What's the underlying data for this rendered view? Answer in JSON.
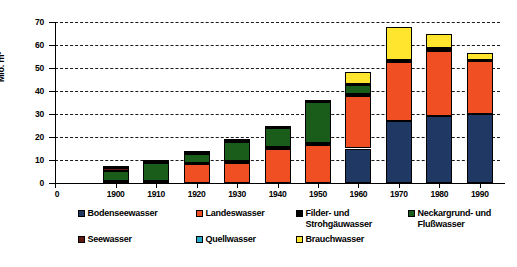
{
  "chart_data": {
    "type": "bar",
    "subtype": "stacked-column",
    "title": "",
    "xlabel": "",
    "ylabel": "Mio. m³",
    "ylim": [
      0,
      70
    ],
    "ytick_step": 10,
    "yticks": [
      "0",
      "10",
      "20",
      "30",
      "40",
      "50",
      "60",
      "70"
    ],
    "grid": true,
    "grid_style": "dashed-horizontal",
    "legend_position": "bottom",
    "origin_tick_label": "0",
    "categories": [
      "1900",
      "1910",
      "1920",
      "1930",
      "1940",
      "1950",
      "1960",
      "1970",
      "1980",
      "1990"
    ],
    "series": [
      {
        "name": "Bodenseewasser",
        "color": "#1F3864",
        "values": [
          0,
          0,
          0,
          0,
          0,
          0,
          15.0,
          27.0,
          29.0,
          30.0
        ]
      },
      {
        "name": "Landeswasser",
        "color": "#F04E23",
        "values": [
          0,
          0,
          8.2,
          8.8,
          15.0,
          16.5,
          23.0,
          25.5,
          28.5,
          23.0
        ]
      },
      {
        "name": "Filder- und\nStrohgäuwasser",
        "color": "#000000",
        "values": [
          0.7,
          0.8,
          0.7,
          0.7,
          0.7,
          0.7,
          0.8,
          1.0,
          1.2,
          0.5
        ]
      },
      {
        "name": "Neckargrund- und\nFlußwasser",
        "color": "#1A5C1A",
        "values": [
          4.5,
          7.8,
          3.8,
          8.5,
          8.0,
          18.0,
          4.0,
          0,
          0,
          0
        ]
      },
      {
        "name": "Seewasser",
        "color": "#5E1A12",
        "values": [
          1.3,
          0.6,
          0.5,
          0.5,
          0.5,
          0.3,
          0,
          0,
          0,
          0
        ]
      },
      {
        "name": "Quellwasser",
        "color": "#29A9C9",
        "values": [
          0.8,
          0.7,
          0.7,
          0.6,
          0.6,
          0.4,
          0.3,
          0,
          0,
          0
        ]
      },
      {
        "name": "Brauchwasser",
        "color": "#FFE52E",
        "values": [
          0,
          0,
          0,
          0,
          0,
          0,
          5.0,
          14.5,
          6.0,
          3.0
        ]
      }
    ],
    "totals": [
      7.3,
      9.9,
      13.9,
      19.1,
      24.8,
      35.9,
      48.1,
      68.0,
      64.7,
      56.5
    ]
  },
  "legend": {
    "items": [
      {
        "label": "Bodenseewasser",
        "color": "#1F3864"
      },
      {
        "label": "Landeswasser",
        "color": "#F04E23"
      },
      {
        "label": "Filder- und\nStrohgäuwasser",
        "color": "#000000"
      },
      {
        "label": "Neckargrund- und\nFlußwasser",
        "color": "#1A5C1A"
      },
      {
        "label": "Seewasser",
        "color": "#5E1A12"
      },
      {
        "label": "Quellwasser",
        "color": "#29A9C9"
      },
      {
        "label": "Brauchwasser",
        "color": "#FFE52E"
      }
    ]
  }
}
